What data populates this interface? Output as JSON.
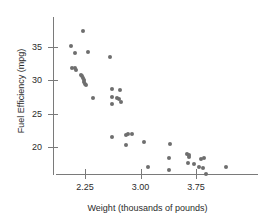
{
  "chart_data": {
    "type": "scatter",
    "title": "",
    "xlabel": "Weight (thousands of pounds)",
    "ylabel": "Fuel Efficiency (mpg)",
    "xlim": [
      1.95,
      4.25
    ],
    "ylim": [
      15.0,
      38.5
    ],
    "xticks": [
      2.25,
      3.0,
      3.75
    ],
    "xtick_labels": [
      "2.25",
      "3.00",
      "3.75"
    ],
    "yticks": [
      20,
      25,
      30,
      35
    ],
    "ytick_labels": [
      "20",
      "25",
      "30",
      "35"
    ],
    "grid": false,
    "legend": null,
    "marker_color": "#6e6e6e",
    "axis_color": "#7a7a7a",
    "points": [
      {
        "x": 2.06,
        "y": 35.1
      },
      {
        "x": 2.12,
        "y": 34.1
      },
      {
        "x": 2.22,
        "y": 37.4
      },
      {
        "x": 2.29,
        "y": 34.2
      },
      {
        "x": 2.07,
        "y": 31.9
      },
      {
        "x": 2.11,
        "y": 31.8
      },
      {
        "x": 2.13,
        "y": 31.6
      },
      {
        "x": 2.19,
        "y": 30.8
      },
      {
        "x": 2.21,
        "y": 30.6
      },
      {
        "x": 2.22,
        "y": 30.4
      },
      {
        "x": 2.23,
        "y": 30.1
      },
      {
        "x": 2.24,
        "y": 29.8
      },
      {
        "x": 2.25,
        "y": 29.5
      },
      {
        "x": 2.26,
        "y": 29.3
      },
      {
        "x": 2.36,
        "y": 27.3
      },
      {
        "x": 2.59,
        "y": 33.5
      },
      {
        "x": 2.62,
        "y": 28.7
      },
      {
        "x": 2.72,
        "y": 28.6
      },
      {
        "x": 2.62,
        "y": 27.5
      },
      {
        "x": 2.68,
        "y": 27.3
      },
      {
        "x": 2.71,
        "y": 27.2
      },
      {
        "x": 2.61,
        "y": 26.5
      },
      {
        "x": 2.73,
        "y": 26.8
      },
      {
        "x": 2.61,
        "y": 21.5
      },
      {
        "x": 2.8,
        "y": 21.8
      },
      {
        "x": 2.83,
        "y": 21.9
      },
      {
        "x": 2.89,
        "y": 21.9
      },
      {
        "x": 2.81,
        "y": 20.3
      },
      {
        "x": 3.05,
        "y": 20.8
      },
      {
        "x": 3.1,
        "y": 17.0
      },
      {
        "x": 3.4,
        "y": 20.5
      },
      {
        "x": 3.38,
        "y": 18.3
      },
      {
        "x": 3.38,
        "y": 16.5
      },
      {
        "x": 3.63,
        "y": 19.0
      },
      {
        "x": 3.65,
        "y": 18.8
      },
      {
        "x": 3.66,
        "y": 18.5
      },
      {
        "x": 3.64,
        "y": 17.6
      },
      {
        "x": 3.72,
        "y": 17.5
      },
      {
        "x": 3.82,
        "y": 18.2
      },
      {
        "x": 3.86,
        "y": 18.4
      },
      {
        "x": 3.79,
        "y": 17.0
      },
      {
        "x": 3.84,
        "y": 16.9
      },
      {
        "x": 3.89,
        "y": 15.9
      },
      {
        "x": 4.16,
        "y": 17.0
      }
    ]
  }
}
